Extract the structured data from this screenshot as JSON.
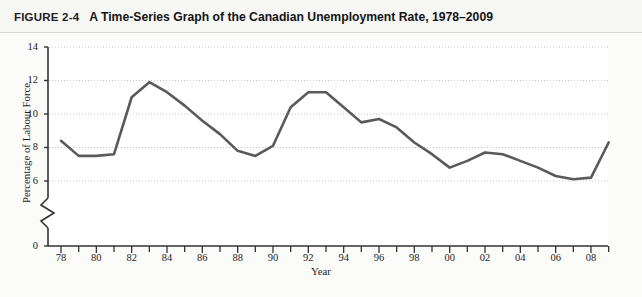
{
  "figure": {
    "label": "FIGURE 2-4",
    "title": "A Time-Series Graph of the Canadian Unemployment Rate, 1978–2009"
  },
  "chart_data": {
    "type": "line",
    "title": "A Time-Series Graph of the Canadian Unemployment Rate, 1978–2009",
    "xlabel": "Year",
    "ylabel": "Percentage of Labour Force",
    "xlim": [
      1978,
      2009
    ],
    "ylim": [
      0,
      14
    ],
    "y_axis_break": true,
    "y_break_between": [
      0,
      6
    ],
    "grid": "horizontal-dotted",
    "legend": "none",
    "line_color": "#5a5a5a",
    "x_tick_labels": [
      "78",
      "80",
      "82",
      "84",
      "86",
      "88",
      "90",
      "92",
      "94",
      "96",
      "98",
      "00",
      "02",
      "04",
      "06",
      "08"
    ],
    "x_tick_values": [
      1978,
      1980,
      1982,
      1984,
      1986,
      1988,
      1990,
      1992,
      1994,
      1996,
      1998,
      2000,
      2002,
      2004,
      2006,
      2008
    ],
    "x_minor_tick_values": [
      1979,
      1981,
      1983,
      1985,
      1987,
      1989,
      1991,
      1993,
      1995,
      1997,
      1999,
      2001,
      2003,
      2005,
      2007,
      2009
    ],
    "y_tick_labels": [
      "0",
      "6",
      "8",
      "10",
      "12",
      "14"
    ],
    "y_tick_values": [
      0,
      6,
      8,
      10,
      12,
      14
    ],
    "gridline_values": [
      6,
      8,
      10,
      12,
      14
    ],
    "x": [
      1978,
      1979,
      1980,
      1981,
      1982,
      1983,
      1984,
      1985,
      1986,
      1987,
      1988,
      1989,
      1990,
      1991,
      1992,
      1993,
      1994,
      1995,
      1996,
      1997,
      1998,
      1999,
      2000,
      2001,
      2002,
      2003,
      2004,
      2005,
      2006,
      2007,
      2008,
      2009
    ],
    "series": [
      {
        "name": "Canadian Unemployment Rate",
        "units": "Percentage of Labour Force",
        "values": [
          8.4,
          7.5,
          7.5,
          7.6,
          11.0,
          11.9,
          11.3,
          10.5,
          9.6,
          8.8,
          7.8,
          7.5,
          8.1,
          10.4,
          11.3,
          11.3,
          10.4,
          9.5,
          9.7,
          9.2,
          8.3,
          7.6,
          6.8,
          7.2,
          7.7,
          7.6,
          7.2,
          6.8,
          6.3,
          6.1,
          6.2,
          8.3
        ]
      }
    ]
  }
}
